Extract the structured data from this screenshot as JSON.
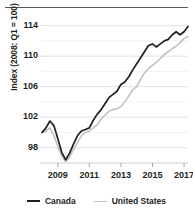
{
  "chart_data": {
    "type": "line",
    "title": "",
    "xlabel": "",
    "ylabel": "Index (2008: Q1 = 100)",
    "ylim": [
      96,
      115
    ],
    "xlim": [
      2008.0,
      2017.25
    ],
    "yticks": [
      98,
      102,
      106,
      110,
      114
    ],
    "ytick_labels": [
      "98",
      "102",
      "106",
      "110",
      "114"
    ],
    "xticks": [
      2009,
      2011,
      2013,
      2015,
      2017
    ],
    "xtick_labels": [
      "2009",
      "2011",
      "2013",
      "2015",
      "2017"
    ],
    "minor_gridlines": [
      98,
      100,
      102,
      104,
      106,
      108,
      110,
      112,
      114
    ],
    "grid": true,
    "legend_position": "bottom",
    "x": [
      2008.0,
      2008.25,
      2008.5,
      2008.75,
      2009.0,
      2009.25,
      2009.5,
      2009.75,
      2010.0,
      2010.25,
      2010.5,
      2010.75,
      2011.0,
      2011.25,
      2011.5,
      2011.75,
      2012.0,
      2012.25,
      2012.5,
      2012.75,
      2013.0,
      2013.25,
      2013.5,
      2013.75,
      2014.0,
      2014.25,
      2014.5,
      2014.75,
      2015.0,
      2015.25,
      2015.5,
      2015.75,
      2016.0,
      2016.25,
      2016.5,
      2016.75,
      2017.0,
      2017.25
    ],
    "series": [
      {
        "name": "Canada",
        "color": "#231f20",
        "values": [
          100.0,
          100.6,
          101.5,
          100.9,
          99.2,
          97.4,
          96.4,
          97.3,
          98.5,
          99.6,
          100.2,
          100.4,
          100.6,
          101.6,
          102.4,
          103.0,
          103.8,
          104.6,
          105.0,
          105.4,
          106.3,
          106.6,
          107.3,
          108.2,
          109.0,
          109.8,
          110.6,
          111.4,
          111.6,
          111.2,
          111.6,
          112.0,
          112.2,
          112.8,
          113.2,
          112.8,
          113.2,
          113.9
        ]
      },
      {
        "name": "United States",
        "color": "#bcbec0",
        "values": [
          100.0,
          100.2,
          100.6,
          99.6,
          98.2,
          96.9,
          96.2,
          96.8,
          97.8,
          98.7,
          99.6,
          100.0,
          100.2,
          100.6,
          101.0,
          101.8,
          102.3,
          102.8,
          103.0,
          103.1,
          103.4,
          104.0,
          104.8,
          105.6,
          106.0,
          107.0,
          107.8,
          108.4,
          108.8,
          109.2,
          109.7,
          110.2,
          110.6,
          111.0,
          111.3,
          111.8,
          112.3,
          112.6
        ]
      }
    ]
  },
  "legend": {
    "items": [
      {
        "label": "Canada",
        "color": "#231f20"
      },
      {
        "label": "United States",
        "color": "#bcbec0"
      }
    ]
  },
  "axis": {
    "y_title": "Index (2008: Q1 = 100)"
  }
}
